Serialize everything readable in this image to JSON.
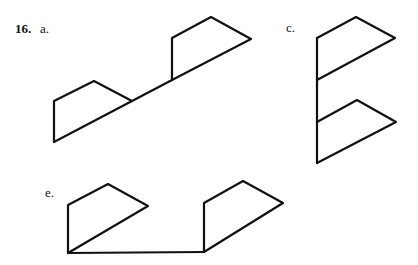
{
  "problem": {
    "number": "16.",
    "parts": [
      {
        "label": "a.",
        "x": 40,
        "y": 22
      },
      {
        "label": "c.",
        "x": 286,
        "y": 21
      },
      {
        "label": "e.",
        "x": 45,
        "y": 186
      }
    ]
  },
  "figures": {
    "a": {
      "description": "Two quadrilateral flags joined by a diagonal baseline",
      "polylines": [
        "54,142 54,101 94,81 132,101",
        "54,142 172,80",
        "172,80 172,38 211,17 251,39 172,80"
      ]
    },
    "c": {
      "description": "Vertical spine with two flags pointing right",
      "polylines": [
        "317,38 317,163",
        "317,38 356,17 395,38 317,80",
        "317,122 357,100 396,122 317,163"
      ]
    },
    "e": {
      "description": "Two flags connected by horizontal baseline",
      "polylines": [
        "68,253 68,205 108,184 148,206 68,253",
        "68,253 204,252",
        "204,252 204,203 243,181 283,203 204,252"
      ]
    }
  },
  "style": {
    "line_color": "#111111",
    "background": "#ffffff"
  }
}
